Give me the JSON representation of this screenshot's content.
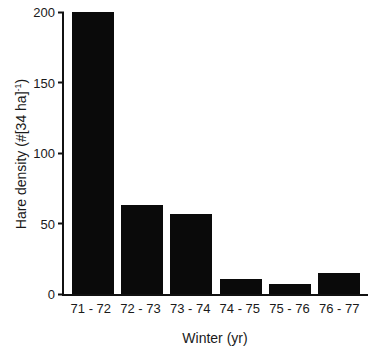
{
  "figure": {
    "background_color": "#ffffff",
    "bar_color": "#0a0a0a",
    "axis_color": "#111111",
    "text_color": "#1a1a1a"
  },
  "chart_data": {
    "type": "bar",
    "title": "",
    "categories": [
      "71 - 72",
      "72 - 73",
      "73 - 74",
      "74 - 75",
      "75 - 76",
      "76 - 77"
    ],
    "values": [
      200,
      63,
      57,
      11,
      7,
      15
    ],
    "xlabel": "Winter (yr)",
    "ylabel": "Hare density (#[34 ha])^-1",
    "ylabel_main": "Hare density (#[34 ha]",
    "ylabel_sup": "-1",
    "ylabel_close": ")",
    "ylim": [
      0,
      200
    ],
    "yticks": [
      0,
      50,
      100,
      150,
      200
    ],
    "grid": false,
    "legend": null
  }
}
